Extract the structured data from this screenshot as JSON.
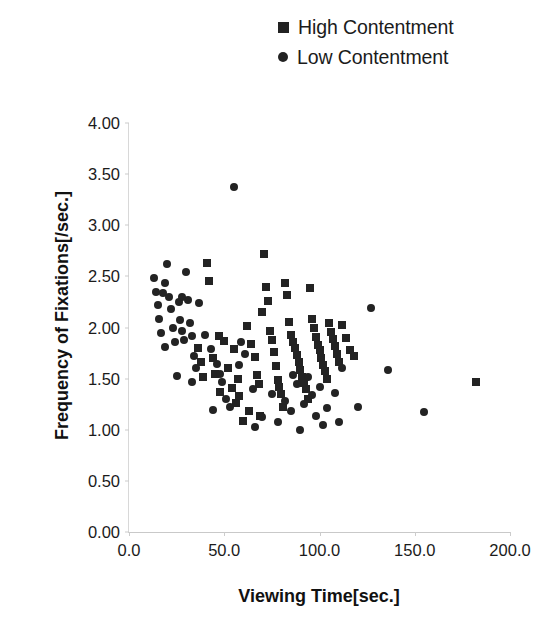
{
  "chart_data": {
    "type": "scatter",
    "title": "",
    "xlabel": "Viewing Time[sec.]",
    "ylabel": "Frequency of Fixations[/sec.]",
    "xlim": [
      0,
      200
    ],
    "ylim": [
      0,
      4
    ],
    "xticks": [
      "0.0",
      "50.0",
      "100.0",
      "150.0",
      "200.0"
    ],
    "xtick_values": [
      0,
      50,
      100,
      150,
      200
    ],
    "yticks": [
      "0.00",
      "0.50",
      "1.00",
      "1.50",
      "2.00",
      "2.50",
      "3.00",
      "3.50",
      "4.00"
    ],
    "ytick_values": [
      0,
      0.5,
      1,
      1.5,
      2,
      2.5,
      3,
      3.5,
      4
    ],
    "grid": false,
    "legend_position": "top-right",
    "marker_color": "#232323",
    "series": [
      {
        "name": "High Contentment",
        "marker": "square",
        "points": [
          [
            41,
            2.63
          ],
          [
            42,
            2.45
          ],
          [
            47,
            1.92
          ],
          [
            50,
            1.87
          ],
          [
            44,
            1.7
          ],
          [
            45,
            1.55
          ],
          [
            48,
            1.37
          ],
          [
            52,
            1.6
          ],
          [
            55,
            1.79
          ],
          [
            57,
            1.5
          ],
          [
            58,
            1.33
          ],
          [
            60,
            1.09
          ],
          [
            62,
            2.01
          ],
          [
            64,
            1.84
          ],
          [
            66,
            1.71
          ],
          [
            67,
            1.54
          ],
          [
            68,
            1.45
          ],
          [
            70,
            2.15
          ],
          [
            71,
            2.72
          ],
          [
            72,
            2.4
          ],
          [
            73,
            2.26
          ],
          [
            74,
            1.97
          ],
          [
            75,
            1.88
          ],
          [
            76,
            1.76
          ],
          [
            77,
            1.62
          ],
          [
            78,
            1.49
          ],
          [
            79,
            1.42
          ],
          [
            80,
            1.35
          ],
          [
            81,
            1.22
          ],
          [
            82,
            2.44
          ],
          [
            83,
            2.32
          ],
          [
            84,
            2.05
          ],
          [
            85,
            1.93
          ],
          [
            86,
            1.86
          ],
          [
            87,
            1.8
          ],
          [
            88,
            1.73
          ],
          [
            89,
            1.66
          ],
          [
            90,
            1.58
          ],
          [
            91,
            1.52
          ],
          [
            92,
            1.46
          ],
          [
            93,
            1.4
          ],
          [
            94,
            1.3
          ],
          [
            95,
            2.39
          ],
          [
            96,
            2.08
          ],
          [
            97,
            2.0
          ],
          [
            98,
            1.91
          ],
          [
            99,
            1.83
          ],
          [
            100,
            1.78
          ],
          [
            101,
            1.7
          ],
          [
            102,
            1.63
          ],
          [
            103,
            1.57
          ],
          [
            104,
            1.5
          ],
          [
            105,
            2.04
          ],
          [
            106,
            1.96
          ],
          [
            107,
            1.89
          ],
          [
            108,
            1.82
          ],
          [
            109,
            1.74
          ],
          [
            110,
            1.66
          ],
          [
            112,
            2.02
          ],
          [
            114,
            1.9
          ],
          [
            116,
            1.78
          ],
          [
            118,
            1.72
          ],
          [
            36,
            1.8
          ],
          [
            38,
            1.66
          ],
          [
            39,
            1.52
          ],
          [
            54,
            1.41
          ],
          [
            56,
            1.26
          ],
          [
            63,
            1.18
          ],
          [
            69,
            1.13
          ],
          [
            182,
            1.47
          ]
        ]
      },
      {
        "name": "Low Contentment",
        "marker": "circle",
        "points": [
          [
            13,
            2.48
          ],
          [
            14,
            2.35
          ],
          [
            15,
            2.22
          ],
          [
            16,
            2.08
          ],
          [
            17,
            1.95
          ],
          [
            18,
            2.34
          ],
          [
            20,
            2.62
          ],
          [
            21,
            2.3
          ],
          [
            22,
            2.18
          ],
          [
            23,
            2.0
          ],
          [
            24,
            1.86
          ],
          [
            25,
            1.53
          ],
          [
            26,
            2.25
          ],
          [
            27,
            2.07
          ],
          [
            28,
            1.97
          ],
          [
            29,
            1.88
          ],
          [
            30,
            2.54
          ],
          [
            31,
            2.27
          ],
          [
            32,
            2.04
          ],
          [
            33,
            1.92
          ],
          [
            34,
            1.72
          ],
          [
            35,
            1.6
          ],
          [
            37,
            2.24
          ],
          [
            40,
            1.93
          ],
          [
            43,
            1.79
          ],
          [
            46,
            1.64
          ],
          [
            49,
            1.47
          ],
          [
            51,
            1.3
          ],
          [
            53,
            1.22
          ],
          [
            55,
            3.37
          ],
          [
            59,
            1.86
          ],
          [
            61,
            1.74
          ],
          [
            65,
            1.4
          ],
          [
            66,
            1.03
          ],
          [
            75,
            1.35
          ],
          [
            82,
            1.28
          ],
          [
            85,
            1.18
          ],
          [
            88,
            1.45
          ],
          [
            90,
            1.0
          ],
          [
            92,
            1.25
          ],
          [
            96,
            1.34
          ],
          [
            100,
            1.42
          ],
          [
            104,
            1.21
          ],
          [
            108,
            1.36
          ],
          [
            112,
            1.6
          ],
          [
            120,
            1.22
          ],
          [
            127,
            2.19
          ],
          [
            136,
            1.58
          ],
          [
            155,
            1.17
          ],
          [
            19,
            1.81
          ],
          [
            19,
            2.44
          ],
          [
            28,
            2.3
          ],
          [
            33,
            1.47
          ],
          [
            44,
            1.19
          ],
          [
            48,
            1.55
          ],
          [
            58,
            1.63
          ],
          [
            70,
            1.12
          ],
          [
            78,
            1.08
          ],
          [
            86,
            1.54
          ],
          [
            94,
            1.52
          ],
          [
            98,
            1.13
          ],
          [
            102,
            1.05
          ],
          [
            110,
            1.08
          ]
        ]
      }
    ]
  },
  "legend": {
    "items": [
      {
        "label": "High Contentment",
        "marker": "square"
      },
      {
        "label": "Low Contentment",
        "marker": "circle"
      }
    ]
  }
}
